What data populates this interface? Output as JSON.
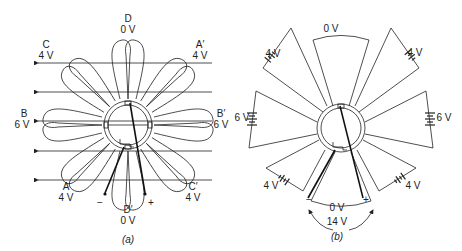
{
  "figure_a": {
    "caption": "(a)",
    "coil_labels": {
      "D": {
        "name": "D",
        "voltage": "0 V"
      },
      "A_prime": {
        "name": "A′",
        "voltage": "4 V"
      },
      "B_prime": {
        "name": "B′",
        "voltage": "6 V"
      },
      "C_prime": {
        "name": "C′",
        "voltage": "4 V"
      },
      "D_prime": {
        "name": "D′",
        "voltage": "0 V"
      },
      "A": {
        "name": "A",
        "voltage": "4 V"
      },
      "B": {
        "name": "B",
        "voltage": "6 V"
      },
      "C": {
        "name": "C",
        "voltage": "4 V"
      }
    },
    "brush_minus": "−",
    "brush_plus": "+"
  },
  "figure_b": {
    "caption": "(b)",
    "top_voltage": "0 V",
    "upper_left_voltage": "4 V",
    "upper_right_voltage": "4 V",
    "left_voltage": "6 V",
    "right_voltage": "6 V",
    "lower_left_voltage": "4 V",
    "lower_right_voltage": "4 V",
    "bottom_voltage": "0 V",
    "total_voltage": "14 V",
    "brush_minus": "−",
    "brush_plus": "+"
  }
}
